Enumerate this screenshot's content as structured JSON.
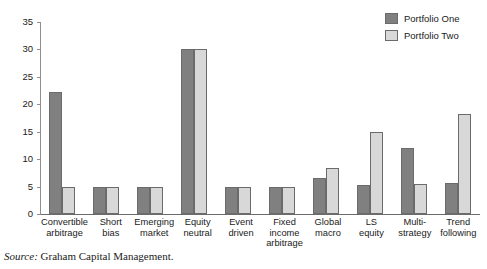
{
  "chart_data": {
    "type": "bar",
    "title": "",
    "xlabel": "",
    "ylabel": "",
    "ylim": [
      0,
      35
    ],
    "yticks": [
      0,
      5,
      10,
      15,
      20,
      25,
      30,
      35
    ],
    "grid": false,
    "legend_position": "top-right",
    "categories": [
      "Convertible arbitrage",
      "Short bias",
      "Emerging market",
      "Equity neutral",
      "Event driven",
      "Fixed income arbitrage",
      "Global macro",
      "LS equity",
      "Multi-strategy",
      "Trend following"
    ],
    "category_lines": [
      [
        "Convertible",
        "arbitrage"
      ],
      [
        "Short",
        "bias"
      ],
      [
        "Emerging",
        "market"
      ],
      [
        "Equity",
        "neutral"
      ],
      [
        "Event",
        "driven"
      ],
      [
        "Fixed",
        "income",
        "arbitrage"
      ],
      [
        "Global",
        "macro"
      ],
      [
        "LS",
        "equity"
      ],
      [
        "Multi-",
        "strategy"
      ],
      [
        "Trend",
        "following"
      ]
    ],
    "series": [
      {
        "name": "Portfolio One",
        "color": "#808080",
        "values": [
          22.3,
          5,
          5,
          30,
          5,
          5,
          6.5,
          5.3,
          12,
          5.6
        ]
      },
      {
        "name": "Portfolio Two",
        "color": "#d8d8d8",
        "values": [
          5,
          5,
          5,
          30,
          5,
          5,
          8.3,
          15,
          5.4,
          18.3
        ]
      }
    ]
  },
  "legend": {
    "items": [
      {
        "label": "Portfolio One",
        "color": "#808080"
      },
      {
        "label": "Portfolio Two",
        "color": "#d8d8d8"
      }
    ]
  },
  "caption": {
    "source_word": "Source:",
    "source_text": " Graham Capital Management."
  }
}
